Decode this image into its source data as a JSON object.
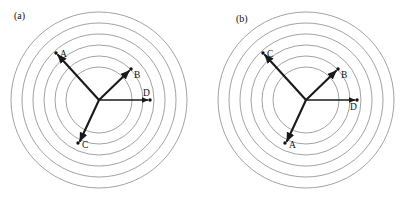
{
  "figure": {
    "background_color": "#ffffff",
    "ring_color": "#8a8a8a",
    "arm_color": "#1a1a1a",
    "node_color": "#111111",
    "width": 409,
    "height": 200,
    "ring_count": 6,
    "ring_radii": [
      33,
      44,
      55,
      66,
      77,
      88
    ]
  },
  "panels": [
    {
      "key": "a",
      "caption": "(a)",
      "caption_x": 14,
      "caption_y": 19,
      "center_x": 99,
      "center_y": 100,
      "nodes": [
        {
          "label": "A",
          "dot_x": 56,
          "dot_y": 53,
          "label_x": 60,
          "label_y": 57,
          "arrow": true,
          "tip_x": 58,
          "tip_y": 55
        },
        {
          "label": "B",
          "dot_x": 131,
          "dot_y": 69,
          "label_x": 134,
          "label_y": 78,
          "arrow": true,
          "tip_x": 129,
          "tip_y": 71
        },
        {
          "label": "C",
          "dot_x": 78,
          "dot_y": 143,
          "label_x": 82,
          "label_y": 148,
          "arrow": true,
          "tip_x": 80,
          "tip_y": 141
        },
        {
          "label": "D",
          "dot_x": 150,
          "dot_y": 100,
          "label_x": 143,
          "label_y": 96,
          "arrow": true,
          "tip_x": 148,
          "tip_y": 100
        }
      ]
    },
    {
      "key": "b",
      "caption": "(b)",
      "caption_x": 236,
      "caption_y": 22,
      "center_x": 306,
      "center_y": 100,
      "nodes": [
        {
          "label": "C",
          "dot_x": 263,
          "dot_y": 53,
          "label_x": 267,
          "label_y": 57,
          "arrow": true,
          "tip_x": 265,
          "tip_y": 55
        },
        {
          "label": "B",
          "dot_x": 338,
          "dot_y": 69,
          "label_x": 341,
          "label_y": 78,
          "arrow": true,
          "tip_x": 336,
          "tip_y": 71
        },
        {
          "label": "A",
          "dot_x": 285,
          "dot_y": 143,
          "label_x": 289,
          "label_y": 148,
          "arrow": true,
          "tip_x": 287,
          "tip_y": 141
        },
        {
          "label": "D",
          "dot_x": 357,
          "dot_y": 100,
          "label_x": 350,
          "label_y": 110,
          "arrow": true,
          "tip_x": 355,
          "tip_y": 100
        }
      ]
    }
  ]
}
